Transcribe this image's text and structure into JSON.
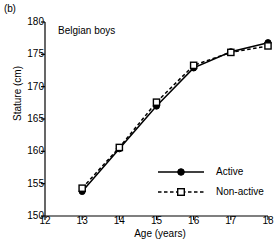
{
  "panel": {
    "label": "(b)"
  },
  "chart_data": {
    "type": "line",
    "title": "",
    "annotation": "Belgian boys",
    "xlabel": "Age (years)",
    "ylabel": "Stature (cm)",
    "xlim": [
      12,
      18
    ],
    "ylim": [
      150,
      180
    ],
    "xticks": [
      12,
      13,
      14,
      15,
      16,
      17,
      18
    ],
    "yticks": [
      150,
      155,
      160,
      165,
      170,
      175,
      180
    ],
    "grid": false,
    "legend_position": "lower-right",
    "x": [
      13,
      14,
      15,
      16,
      17,
      18
    ],
    "series": [
      {
        "name": "Active",
        "marker": "filled-circle",
        "linestyle": "solid",
        "color": "#000000",
        "values": [
          153.8,
          160.4,
          167.0,
          172.9,
          175.4,
          176.8
        ]
      },
      {
        "name": "Non-active",
        "marker": "open-square",
        "linestyle": "dashed",
        "color": "#000000",
        "values": [
          154.3,
          160.6,
          167.6,
          173.3,
          175.3,
          176.3
        ]
      }
    ]
  },
  "legend": {
    "items": [
      {
        "label": "Active"
      },
      {
        "label": "Non-active"
      }
    ]
  }
}
